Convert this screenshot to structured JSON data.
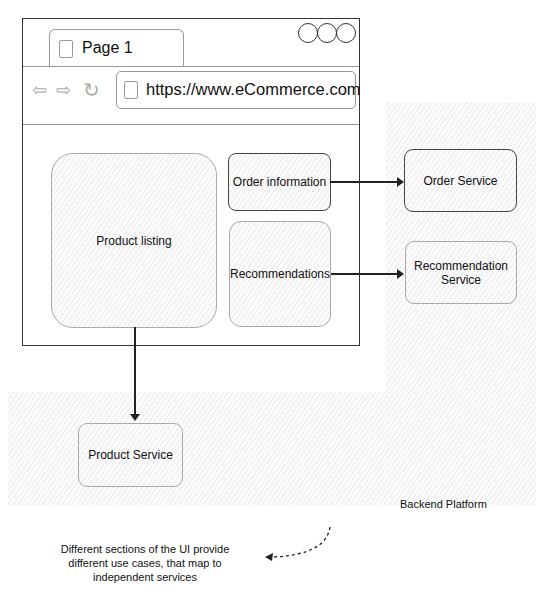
{
  "diagram": {
    "browser": {
      "tab_label": "Page 1",
      "url": "https://www.eCommerce.com",
      "window_controls": [
        "circle",
        "circle",
        "circle"
      ],
      "nav_icons": [
        "back-arrow-icon",
        "forward-arrow-icon",
        "refresh-icon"
      ]
    },
    "ui_sections": {
      "product_listing": "Product listing",
      "order_information": "Order information",
      "recommendations": "Recommendations"
    },
    "services": {
      "order_service": "Order Service",
      "recommendation_service_line1": "Recommendation",
      "recommendation_service_line2": "Service",
      "product_service": "Product Service"
    },
    "region_label": "Backend Platform",
    "annotation": {
      "line1": "Different sections of the UI provide",
      "line2": "different use cases, that map to",
      "line3": "independent services"
    },
    "connections": [
      {
        "from": "Order information",
        "to": "Order Service"
      },
      {
        "from": "Recommendations",
        "to": "Recommendation Service"
      },
      {
        "from": "Product listing",
        "to": "Product Service"
      }
    ]
  }
}
